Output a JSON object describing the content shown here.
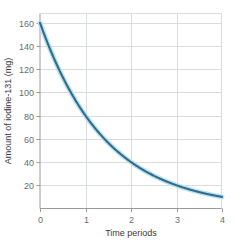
{
  "chart_data": {
    "type": "line",
    "title": "",
    "xlabel": "Time periods",
    "ylabel": "Amount of iodine-131 (mg)",
    "xlim": [
      0,
      4
    ],
    "ylim": [
      0,
      168
    ],
    "xticks": [
      "0",
      "1",
      "2",
      "3",
      "4"
    ],
    "xtick_values": [
      0,
      1,
      2,
      3,
      4
    ],
    "yticks": [
      "20",
      "40",
      "60",
      "80",
      "100",
      "120",
      "140",
      "160"
    ],
    "ytick_values": [
      20,
      40,
      60,
      80,
      100,
      120,
      140,
      160
    ],
    "grid": true,
    "legend": "none",
    "series": [
      {
        "name": "iodine-131 decay",
        "color": "#2e6e8c",
        "halo_color": "#bfe0ef",
        "x": [
          0,
          0.25,
          0.5,
          0.75,
          1,
          1.25,
          1.5,
          1.75,
          2,
          2.25,
          2.5,
          2.75,
          3,
          3.25,
          3.5,
          3.75,
          4
        ],
        "values": [
          160,
          134.5,
          113.1,
          95.1,
          80,
          67.3,
          56.6,
          47.6,
          40,
          33.6,
          28.3,
          23.8,
          20,
          16.8,
          14.1,
          11.9,
          10
        ]
      }
    ],
    "annotations": []
  },
  "style": {
    "background": "#ffffff",
    "grid_color": "#d9dde0",
    "spine_color": "#9a9a9a",
    "tick_label_color": "#6d6d6d",
    "axis_title_color": "#3a3a3a"
  }
}
